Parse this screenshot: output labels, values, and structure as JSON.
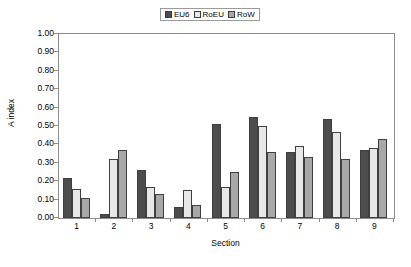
{
  "chart_data": {
    "type": "bar",
    "title": "",
    "xlabel": "Section",
    "ylabel": "A index",
    "ylim": [
      0.0,
      1.0
    ],
    "ytick_step": 0.1,
    "ytick_labels": [
      "0.00",
      "0.10",
      "0.20",
      "0.30",
      "0.40",
      "0.50",
      "0.60",
      "0.70",
      "0.80",
      "0.90",
      "1.00"
    ],
    "grid": false,
    "legend_position": "top-center",
    "categories": [
      "1",
      "2",
      "3",
      "4",
      "5",
      "6",
      "7",
      "8",
      "9"
    ],
    "series": [
      {
        "name": "EU6",
        "color": "#4d4d4d",
        "values": [
          0.22,
          0.02,
          0.26,
          0.06,
          0.51,
          0.55,
          0.36,
          0.54,
          0.37
        ]
      },
      {
        "name": "RoEU",
        "color": "#e8e8e8",
        "values": [
          0.16,
          0.32,
          0.17,
          0.15,
          0.17,
          0.5,
          0.39,
          0.47,
          0.38
        ]
      },
      {
        "name": "RoW",
        "color": "#a8a8a8",
        "values": [
          0.11,
          0.37,
          0.13,
          0.07,
          0.25,
          0.36,
          0.33,
          0.32,
          0.43
        ]
      }
    ]
  },
  "colors": {
    "axis": "#8d8d8d",
    "bar_outline": "#3f3f3f",
    "background": "#ffffff",
    "text": "#000000"
  }
}
